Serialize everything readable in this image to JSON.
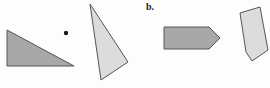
{
  "figure": {
    "label": "b.",
    "background_color": "#fdfdfd",
    "canvas": {
      "width": 270,
      "height": 88
    },
    "palette": {
      "fill_dark": "#a8a8a8",
      "fill_light": "#dcdcdc",
      "stroke": "#555555",
      "dot_color": "#1a1a1a",
      "label_color": "#1a1a1a"
    },
    "shapes": [
      {
        "name": "right-triangle-left",
        "type": "polygon",
        "fill": "#a8a8a8",
        "stroke": "#555555",
        "stroke_width": 1,
        "points": "7,30 7,66 74,66"
      },
      {
        "name": "center-point-dot",
        "type": "circle",
        "fill": "#1a1a1a",
        "cx": 66,
        "cy": 33,
        "r": 2.2
      },
      {
        "name": "scalene-triangle-tall",
        "type": "polygon",
        "fill": "#dcdcdc",
        "stroke": "#555555",
        "stroke_width": 1,
        "points": "90,4 128,62 101,80"
      },
      {
        "name": "arrow-pentagon",
        "type": "polygon",
        "fill": "#a8a8a8",
        "stroke": "#555555",
        "stroke_width": 1,
        "points": "164,27 209,27 220,38 209,49 164,49"
      },
      {
        "name": "tilted-quadrilateral",
        "type": "polygon",
        "fill": "#dcdcdc",
        "stroke": "#555555",
        "stroke_width": 1,
        "points": "260,7 268,50 252,61 246,52 240,13"
      }
    ]
  }
}
